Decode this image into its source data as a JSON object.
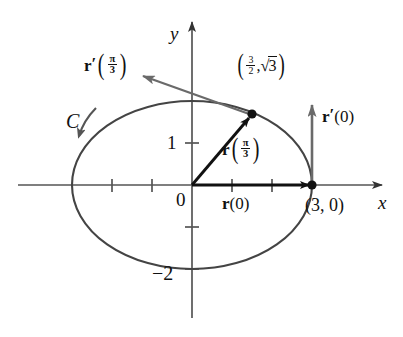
{
  "figure": {
    "type": "vector-calculus-diagram",
    "background_color": "#ffffff",
    "curve_color": "#444444",
    "axis_color": "#555555",
    "vector_color": "#111111",
    "tangent_color": "#6a6a6a",
    "point_color": "#111111"
  },
  "axes": {
    "x_label": "x",
    "y_label": "y",
    "origin_label": "0",
    "x_ticks": [
      -2,
      -1,
      1,
      2
    ],
    "y_ticks": [
      1,
      -1,
      -2
    ],
    "y_tick_labels": {
      "one": "1",
      "minus_two": "−2"
    },
    "unit_px_x": 40,
    "unit_px_y": 42,
    "origin_px": {
      "x": 192,
      "y": 185
    }
  },
  "curve": {
    "name": "C",
    "label": "C",
    "shape": "ellipse",
    "semi_axis_x": 3,
    "semi_axis_y": 2,
    "orientation": "counterclockwise-arrow-on-left"
  },
  "points": [
    {
      "name": "point-at-t-pi-over-3",
      "label_plain": "(3/2, √3)",
      "x_value": "3",
      "x_denominator": "2",
      "separator": ",",
      "radical_symbol": "√",
      "radicand": "3",
      "coords": {
        "x": 1.5,
        "y": 1.7320508
      },
      "px": {
        "x": 252,
        "y": 113
      }
    },
    {
      "name": "point-3-0",
      "label_plain": "(3, 0)",
      "coords": {
        "x": 3,
        "y": 0
      },
      "px": {
        "x": 312,
        "y": 185
      }
    }
  ],
  "vectors": [
    {
      "name": "position-vector-pi-over-3",
      "symbol": "r",
      "prime": false,
      "argument_numerator": "π",
      "argument_denominator": "3",
      "color": "#111111",
      "from": {
        "x": 0,
        "y": 0
      },
      "to": {
        "x": 1.5,
        "y": 1.732
      }
    },
    {
      "name": "position-vector-zero",
      "symbol": "r",
      "prime": false,
      "argument": "0",
      "label_plain": "r(0)",
      "color": "#111111",
      "from": {
        "x": 0,
        "y": 0
      },
      "to": {
        "x": 3,
        "y": 0
      }
    },
    {
      "name": "tangent-vector-pi-over-3",
      "symbol": "r",
      "prime": true,
      "argument_numerator": "π",
      "argument_denominator": "3",
      "color": "#6a6a6a",
      "from": {
        "x": 1.5,
        "y": 1.732
      },
      "to": {
        "x": -2.6,
        "y": 2.6
      }
    },
    {
      "name": "tangent-vector-zero",
      "symbol": "r",
      "prime": true,
      "argument": "0",
      "label_plain": "r′(0)",
      "color": "#6a6a6a",
      "from": {
        "x": 3,
        "y": 0
      },
      "to": {
        "x": 3,
        "y": 1.9
      }
    }
  ],
  "labels": {
    "r_symbol": "r",
    "prime_mark": "′",
    "pi": "π",
    "three": "3",
    "two": "2",
    "zero": "0",
    "paren_open": "(",
    "paren_close": ")",
    "comma": ",",
    "r_zero": "r(0)",
    "point_3_0": "(3, 0)",
    "minus_two": "−2",
    "one": "1",
    "curve_C": "C",
    "axis_x": "x",
    "axis_y": "y",
    "origin": "0",
    "radical": "√"
  }
}
